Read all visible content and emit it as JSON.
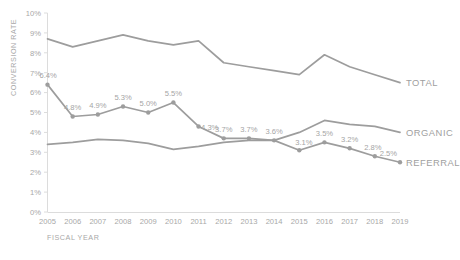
{
  "chart_data": {
    "type": "line",
    "title": "",
    "xlabel": "FISCAL YEAR",
    "ylabel": "CONVERSION RATE",
    "x": [
      2005,
      2006,
      2007,
      2008,
      2009,
      2010,
      2011,
      2012,
      2013,
      2014,
      2015,
      2016,
      2017,
      2018,
      2019
    ],
    "xtick_labels": [
      "2005",
      "2006",
      "2007",
      "2008",
      "2009",
      "2010",
      "2011",
      "2012",
      "2013",
      "2014",
      "2015",
      "2016",
      "2017",
      "2018",
      "2019"
    ],
    "ylim": [
      0,
      10
    ],
    "ytick_labels": [
      "0%",
      "1%",
      "2%",
      "3%",
      "4%",
      "5%",
      "6%",
      "7%",
      "8%",
      "9%",
      "10%"
    ],
    "ytick_values": [
      0,
      1,
      2,
      3,
      4,
      5,
      6,
      7,
      8,
      9,
      10
    ],
    "grid": false,
    "legend_position": "right-inline",
    "series": [
      {
        "name": "TOTAL",
        "color": "#9d9d9d",
        "markers": false,
        "labels_shown": false,
        "values": [
          8.7,
          8.3,
          8.6,
          8.9,
          8.6,
          8.4,
          8.6,
          7.5,
          7.3,
          7.1,
          6.9,
          7.9,
          7.3,
          6.9,
          6.5
        ]
      },
      {
        "name": "ORGANIC",
        "color": "#9d9d9d",
        "markers": false,
        "labels_shown": false,
        "values": [
          3.4,
          3.5,
          3.65,
          3.6,
          3.45,
          3.15,
          3.3,
          3.5,
          3.6,
          3.6,
          4.0,
          4.6,
          4.4,
          4.3,
          4.0
        ]
      },
      {
        "name": "REFERRAL",
        "color": "#9d9d9d",
        "markers": true,
        "labels_shown": true,
        "values": [
          6.4,
          4.8,
          4.9,
          5.3,
          5.0,
          5.5,
          4.3,
          3.7,
          3.7,
          3.6,
          3.1,
          3.5,
          3.2,
          2.8,
          2.5
        ],
        "point_labels": [
          "6.4%",
          "4.8%",
          "4.9%",
          "5.3%",
          "5.0%",
          "5.5%",
          "4.3%",
          "3.7%",
          "3.7%",
          "3.6%",
          "3.1%",
          "3.5%",
          "3.2%",
          "2.8%",
          "2.5%"
        ]
      }
    ]
  },
  "colors": {
    "line": "#9d9d9d",
    "text": "#a8a8a8",
    "axis": "#d8d8d8",
    "background": "#ffffff"
  }
}
